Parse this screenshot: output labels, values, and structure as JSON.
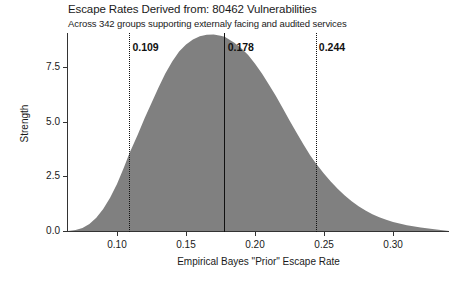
{
  "chart_data": {
    "type": "area",
    "title": "Escape Rates Derived from: 80462 Vulnerabilities",
    "subtitle": "Across 342 groups supporting externaly facing and audited services",
    "xlabel": "Empirical Bayes \"Prior\" Escape Rate",
    "ylabel": "Strength",
    "xlim": [
      0.0645,
      0.3405
    ],
    "ylim": [
      0.0,
      9.05
    ],
    "grid": false,
    "legend": null,
    "fill_color": "#808080",
    "xticks": [
      {
        "value": 0.1,
        "label": "0.10"
      },
      {
        "value": 0.15,
        "label": "0.15"
      },
      {
        "value": 0.2,
        "label": "0.20"
      },
      {
        "value": 0.25,
        "label": "0.25"
      },
      {
        "value": 0.3,
        "label": "0.30"
      }
    ],
    "yticks": [
      {
        "value": 0.0,
        "label": "0.0"
      },
      {
        "value": 2.5,
        "label": "2.5"
      },
      {
        "value": 5.0,
        "label": "5.0"
      },
      {
        "value": 7.5,
        "label": "7.5"
      }
    ],
    "annotations": [
      {
        "name": "lower-bound",
        "value": 0.109,
        "label": "0.109",
        "style": "dotted"
      },
      {
        "name": "mean",
        "value": 0.178,
        "label": "0.178",
        "style": "solid"
      },
      {
        "name": "upper-bound",
        "value": 0.244,
        "label": "0.244",
        "style": "solid-thin"
      }
    ],
    "series": [
      {
        "name": "prior density",
        "x": [
          0.0645,
          0.07,
          0.075,
          0.08,
          0.085,
          0.09,
          0.095,
          0.1,
          0.105,
          0.109,
          0.115,
          0.12,
          0.125,
          0.13,
          0.135,
          0.14,
          0.145,
          0.15,
          0.155,
          0.16,
          0.165,
          0.17,
          0.175,
          0.178,
          0.185,
          0.19,
          0.195,
          0.2,
          0.205,
          0.21,
          0.215,
          0.22,
          0.225,
          0.23,
          0.235,
          0.24,
          0.244,
          0.25,
          0.255,
          0.26,
          0.265,
          0.27,
          0.275,
          0.28,
          0.285,
          0.29,
          0.295,
          0.3,
          0.31,
          0.32,
          0.33,
          0.3405
        ],
        "y": [
          0.0,
          0.04,
          0.14,
          0.32,
          0.6,
          1.0,
          1.52,
          2.15,
          2.9,
          3.55,
          4.4,
          5.15,
          5.85,
          6.55,
          7.2,
          7.75,
          8.2,
          8.52,
          8.75,
          8.9,
          8.97,
          8.98,
          8.93,
          8.88,
          8.6,
          8.35,
          8.05,
          7.65,
          7.2,
          6.7,
          6.18,
          5.62,
          5.05,
          4.5,
          3.96,
          3.45,
          3.1,
          2.62,
          2.25,
          1.92,
          1.62,
          1.36,
          1.13,
          0.94,
          0.77,
          0.63,
          0.51,
          0.41,
          0.26,
          0.16,
          0.08,
          0.0
        ]
      }
    ]
  }
}
